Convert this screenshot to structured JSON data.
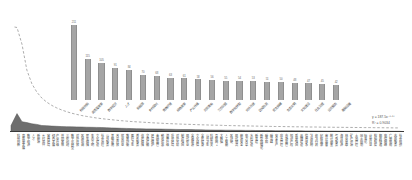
{
  "colors": {
    "bar_fill": "#a5a5a5",
    "bar_edge": "#8f8f8f",
    "area_fill": "#6e6e6e",
    "area_edge": "#555555",
    "baseline": "#3a3a3a",
    "trendline_dash": "#8a8a8a",
    "label_text": "#3c3c3c",
    "value_text": "#6b6b6b"
  },
  "trendline_label": {
    "equation": "y = 187.5x⁻⁰·⁸⁷",
    "r_squared": "R² = 0.9034"
  },
  "chart_data": [
    {
      "type": "bar",
      "title": "",
      "note_visible_title": "",
      "categories": [
        "科技创新",
        "高质量发展",
        "数字经济",
        "人才",
        "新能源",
        "乡村振兴",
        "营商环境",
        "绿色发展",
        "产业升级",
        "共同富裕",
        "三农问题",
        "数字化转型",
        "对外开放",
        "区域协调",
        "民生保障",
        "生态文明",
        "文化建设",
        "社会治理",
        "公共服务",
        "基础设施"
      ],
      "values": [
        211,
        115,
        105,
        91,
        84,
        70,
        68,
        63,
        61,
        58,
        56,
        55,
        54,
        53,
        51,
        50,
        48,
        47,
        45,
        42
      ],
      "xlabel": "",
      "ylabel": "",
      "ylim": [
        0,
        240
      ],
      "grid": false,
      "legend_position": "none",
      "value_labels": true,
      "tick_label_rotation": 45
    },
    {
      "type": "area",
      "title": "",
      "categories": [
        "科技创新",
        "高质量发展",
        "数字经济",
        "人才",
        "新能源",
        "乡村振兴",
        "营商环境",
        "绿色发展",
        "产业升级",
        "共同富裕",
        "三农问题",
        "数字化转型",
        "对外开放",
        "区域协调",
        "民生保障",
        "生态文明",
        "文化建设",
        "社会治理",
        "公共服务",
        "基础设施",
        "改革开放",
        "就业创业",
        "教育均衡",
        "医疗卫生",
        "养老服务",
        "住房保障",
        "交通运输",
        "环境保护",
        "金融监管",
        "税收优惠",
        "消费升级",
        "投资环境",
        "对外贸易",
        "制造强国",
        "现代农业",
        "全域旅游",
        "文化自信",
        "全民健身",
        "公共卫生",
        "科研攻关",
        "互联网+",
        "大数据",
        "人工智能",
        "区块链",
        "现代物流",
        "能源安全",
        "电力改革",
        "水利建设",
        "新基建",
        "新型城镇化",
        "碳中和",
        "碳达峰",
        "安全生产",
        "应急管理",
        "市场监管",
        "知识产权",
        "质量强国",
        "品牌建设",
        "信用体系",
        "法治政府",
        "依法行政",
        "纪检监察",
        "审计监督",
        "统计调查",
        "气象服务",
        "海洋经济",
        "林业草原",
        "矿产资源",
        "土地管理",
        "国土规划",
        "标准化",
        "计量认证",
        "检验检疫",
        "邮政快递",
        "电信网络",
        "广播电视",
        "志愿服务",
        "社会组织"
      ],
      "values": [
        211,
        115,
        105,
        91,
        84,
        70,
        68,
        63,
        61,
        58,
        56,
        55,
        54,
        53,
        51,
        50,
        48,
        47,
        45,
        42,
        40,
        38,
        36,
        34,
        33,
        32,
        31,
        30,
        29,
        28,
        27,
        26,
        25,
        24,
        23,
        22,
        21,
        20,
        19,
        18,
        17,
        16,
        15,
        15,
        14,
        14,
        13,
        13,
        12,
        12,
        11,
        11,
        10,
        10,
        9,
        9,
        8,
        8,
        7,
        7,
        6,
        6,
        5,
        5,
        5,
        4,
        4,
        4,
        3,
        3,
        3,
        3,
        2,
        2,
        2,
        2,
        2,
        2
      ],
      "xlabel": "",
      "ylabel": "",
      "ylim": [
        0,
        220
      ],
      "grid": false,
      "legend_position": "none",
      "trendline": {
        "type": "power",
        "style": "dashed",
        "formula": "y = 187.5x⁻⁰·⁸⁷",
        "r_squared": 0.9034
      }
    }
  ]
}
